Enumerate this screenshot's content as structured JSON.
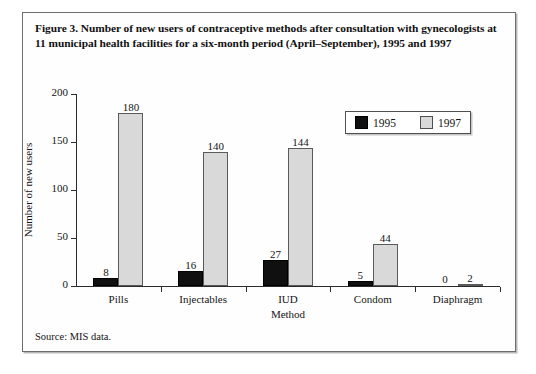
{
  "figure": {
    "caption": "Figure 3. Number of new users of contraceptive methods after consultation with gynecologists at 11 municipal health facilities for a six-month period (April–September), 1995 and 1997",
    "source_note": "Source: MIS data."
  },
  "legend": {
    "entries": [
      {
        "label": "1995",
        "color": "#101010"
      },
      {
        "label": "1997",
        "color": "#d9d9d9"
      }
    ]
  },
  "chart_data": {
    "type": "bar",
    "title": "Figure 3. Number of new users of contraceptive methods after consultation with gynecologists at 11 municipal health facilities for a six-month period (April–September), 1995 and 1997",
    "xlabel": "Method",
    "ylabel": "Number of new users",
    "categories": [
      "Pills",
      "Injectables",
      "IUD",
      "Condom",
      "Diaphragm"
    ],
    "series": [
      {
        "name": "1995",
        "color": "#101010",
        "values": [
          8,
          16,
          27,
          5,
          0
        ]
      },
      {
        "name": "1997",
        "color": "#d9d9d9",
        "values": [
          180,
          140,
          144,
          44,
          2
        ]
      }
    ],
    "ylim": [
      0,
      200
    ],
    "yticks": [
      0,
      50,
      100,
      150,
      200
    ],
    "grid": false,
    "legend_position": "top-right",
    "data_labels": true
  }
}
